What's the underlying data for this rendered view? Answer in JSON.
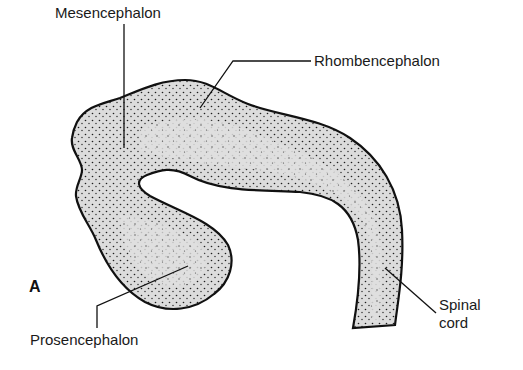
{
  "figure": {
    "panel_letter": "A",
    "labels": {
      "mesencephalon": "Mesencephalon",
      "rhombencephalon": "Rhombencephalon",
      "prosencephalon": "Prosencephalon",
      "spinal_cord_line1": "Spinal",
      "spinal_cord_line2": "cord"
    },
    "colors": {
      "outline": "#111111",
      "fill": "#dcdcdc",
      "stipple": "#1e1e1e",
      "background": "#ffffff"
    }
  }
}
